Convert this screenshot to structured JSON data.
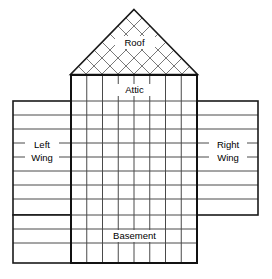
{
  "diagram": {
    "background_color": "#ffffff",
    "line_color": "#1a1a1a",
    "grid_color": "#6e6e6e",
    "labels": {
      "roof": "Roof",
      "attic": "Attic",
      "left_wing_line1": "Left",
      "left_wing_line2": "Wing",
      "right_wing_line1": "Right",
      "right_wing_line2": "Wing",
      "basement": "Basement"
    },
    "geometry": {
      "canvas_width": 272,
      "canvas_height": 279,
      "body_left": 71,
      "body_right": 197,
      "body_top": 75,
      "body_bottom": 263,
      "body_columns": 8,
      "roof_apex_x": 134,
      "roof_apex_y": 10,
      "roof_base_y": 75,
      "roof_diagonal_steps": 8,
      "wing_top": 101,
      "wing_bottom": 215,
      "left_wing_left": 13,
      "right_wing_right": 258,
      "basement_ext_bottom": 263,
      "body_row_lines": [
        101,
        115,
        129,
        143,
        157,
        171,
        185,
        199,
        215,
        229,
        243,
        263
      ],
      "wing_row_lines": [
        115,
        129,
        143,
        157,
        171,
        185,
        199,
        215
      ],
      "basement_row_lines": [
        229,
        243,
        263
      ]
    }
  }
}
